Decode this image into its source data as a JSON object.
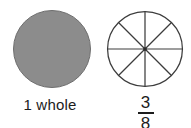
{
  "figures": [
    {
      "id": "whole",
      "kind": "shaded-circle",
      "caption": "1 whole",
      "fill_color": "#8c8c8c",
      "stroke_color": "#6e6e6e",
      "shaded_parts": 1,
      "total_parts": 1
    },
    {
      "id": "eighths",
      "kind": "partitioned-circle",
      "fraction_numerator": "3",
      "fraction_denominator": "8",
      "fill_color": "#ffffff",
      "stroke_color": "#3c3c3c",
      "total_parts": 8,
      "divider_count": 4,
      "divider_angles_degrees": [
        0,
        45,
        90,
        135
      ],
      "center_dot": true
    }
  ],
  "background_color": "#ffffff",
  "text_color": "#1c1c1c"
}
